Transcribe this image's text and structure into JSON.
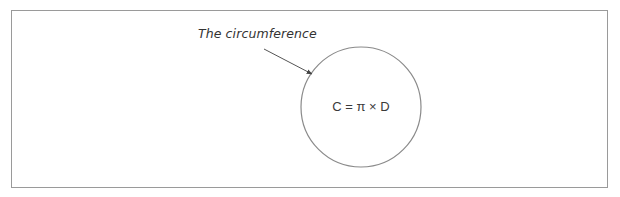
{
  "diagram": {
    "annotation": "The circumference",
    "formula": "C = π × D",
    "shapes": {
      "circle": {
        "cx": 361,
        "cy": 107,
        "r": 60
      },
      "arrow": {
        "from": [
          264,
          49
        ],
        "to": [
          312,
          74
        ]
      }
    },
    "colors": {
      "stroke": "#8a8a8a",
      "text": "#333333",
      "frame": "#9a9a9a"
    }
  }
}
